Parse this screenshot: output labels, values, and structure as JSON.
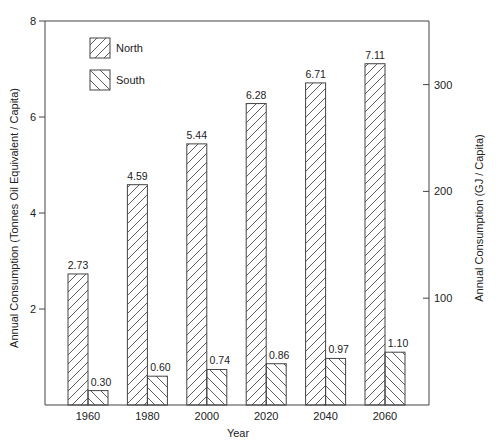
{
  "chart_data": {
    "type": "bar",
    "title": "",
    "xlabel": "Year",
    "ylabel": "Annual Consumption (Tonnes Oil Equivalent / Capita)",
    "y2label": "Annual Consumption (GJ / Capita)",
    "categories": [
      "1960",
      "1980",
      "2000",
      "2020",
      "2040",
      "2060"
    ],
    "series": [
      {
        "name": "North",
        "pattern": "forward-hatch",
        "values": [
          2.73,
          4.59,
          5.44,
          6.28,
          6.71,
          7.11
        ]
      },
      {
        "name": "South",
        "pattern": "back-hatch",
        "values": [
          0.3,
          0.6,
          0.74,
          0.86,
          0.97,
          1.1
        ]
      }
    ],
    "ylim": [
      0,
      8
    ],
    "yticks": [
      "2",
      "4",
      "6",
      "8"
    ],
    "y2ticks": [
      "100",
      "200",
      "300"
    ],
    "grid": false,
    "legend_position": "upper-left"
  }
}
